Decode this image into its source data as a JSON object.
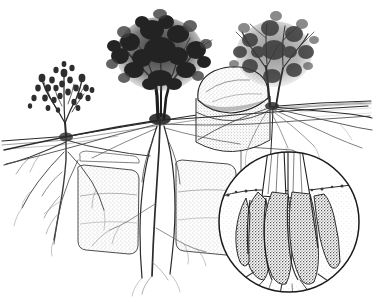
{
  "figure": {
    "name": "root-system-cross-section",
    "medium": "pen-and-ink stipple line drawing",
    "background_color": "#ffffff",
    "ink_color": "#1a1a1a",
    "mid_ink_color": "#4a4a4a",
    "light_ink_color": "#8a8a8a",
    "stipple_color": "#9a9a9a",
    "width": 373,
    "height": 303
  },
  "ground": {
    "name": "ground-line",
    "label": "soil surface",
    "description": "Irregular ground line sloping down from upper right to lower left, drawn with fine hatching",
    "left_y": 140,
    "right_y": 103
  },
  "plants": [
    {
      "id": "shrub-small",
      "label": "small shrub",
      "canopy_style": "sparse clustered leaf tufts on thin upright stems",
      "canopy_tone": "medium",
      "trunk_x": 66,
      "ground_y": 137,
      "canopy_center": [
        64,
        96
      ],
      "canopy_rx": 30,
      "canopy_ry": 26,
      "root_type": "shallow laterals with short taproot",
      "root_depth": 200
    },
    {
      "id": "tree-large",
      "label": "large tree",
      "canopy_style": "dense rounded crown, darkest tone",
      "canopy_tone": "dark",
      "trunk_x": 161,
      "ground_y": 118,
      "canopy_center": [
        160,
        55
      ],
      "canopy_rx": 44,
      "canopy_ry": 38,
      "root_type": "deep sinker roots threading between buried rock slabs",
      "root_depth": 300
    },
    {
      "id": "tree-right",
      "label": "slender tree pair",
      "canopy_style": "open airy branching crown",
      "canopy_tone": "light",
      "trunk_x": 272,
      "ground_y": 106,
      "canopy_center": [
        272,
        55
      ],
      "canopy_rx": 36,
      "canopy_ry": 32,
      "root_type": "wide shallow lateral roots",
      "root_depth": 150
    }
  ],
  "boulder": {
    "name": "buried-boulder",
    "label": "large boulder in cut-away soil pit",
    "center": [
      232,
      90
    ],
    "rx": 36,
    "ry": 22,
    "texture": "stippled"
  },
  "subsoil_rocks": [
    {
      "name": "rock-slab-left",
      "label": "stippled rock slab",
      "x": 78,
      "y": 168,
      "w": 62,
      "h": 88
    },
    {
      "name": "rock-slab-right",
      "label": "stippled rock slab",
      "x": 172,
      "y": 162,
      "w": 58,
      "h": 92
    },
    {
      "name": "rock-slab-far-right",
      "label": "stippled rock slab",
      "x": 238,
      "y": 150,
      "w": 48,
      "h": 60
    }
  ],
  "inset": {
    "name": "magnified-detail-inset",
    "label": "circular magnified detail of root crown burl at soil line",
    "center": [
      289,
      222
    ],
    "radius": 71,
    "border_color": "#1a1a1a",
    "subject": "lignotuber / root burl with vertical furrowed texture",
    "shows_ground_line": true,
    "shows_trunk_base": true,
    "shows_radiating_roots": true
  },
  "accessibility": {
    "alt": "Black and white pen-and-ink botanical illustration. Three woody plants of increasing size stand on a sloping ground line, each shown in cross-section with its root system below. At left a small shrub with shallow laterals and a taproot. In the centre a large dense-crowned tree whose deep roots thread between stippled rock slabs. At right slender trees with wide shallow laterals beside a large buried boulder in a cut-away soil pit. A circular magnified inset at lower right shows the furrowed root burl at the soil line."
  }
}
